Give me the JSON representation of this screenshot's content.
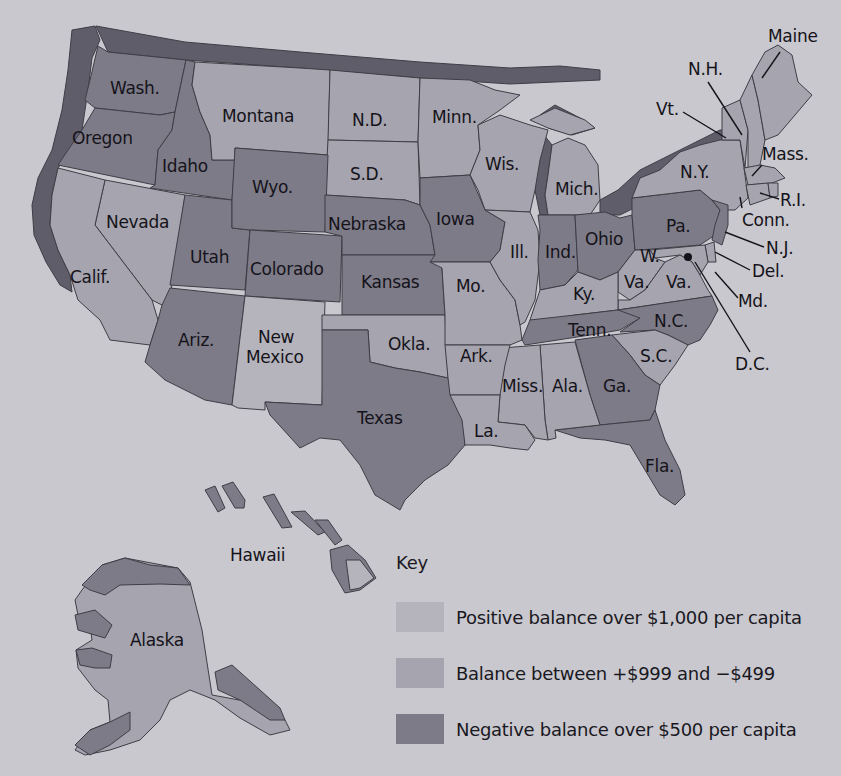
{
  "map": {
    "title": "",
    "legend": {
      "title": "Key",
      "items": [
        {
          "id": "pos",
          "label": "Positive balance over $1,000 per capita",
          "color": "#b5b4bd"
        },
        {
          "id": "bal",
          "label": "Balance between +$999 and −$499",
          "color": "#a6a4ae"
        },
        {
          "id": "neg",
          "label": "Negative balance over $500 per capita",
          "color": "#7e7b88"
        }
      ]
    },
    "states": {
      "wash": {
        "label": "Wash.",
        "category": "neg"
      },
      "oregon": {
        "label": "Oregon",
        "category": "neg"
      },
      "idaho": {
        "label": "Idaho",
        "category": "neg"
      },
      "montana": {
        "label": "Montana",
        "category": "bal"
      },
      "nd": {
        "label": "N.D.",
        "category": "bal"
      },
      "sd": {
        "label": "S.D.",
        "category": "bal"
      },
      "minn": {
        "label": "Minn.",
        "category": "bal"
      },
      "wis": {
        "label": "Wis.",
        "category": "bal"
      },
      "mich": {
        "label": "Mich.",
        "category": "bal"
      },
      "wyo": {
        "label": "Wyo.",
        "category": "neg"
      },
      "nevada": {
        "label": "Nevada",
        "category": "bal"
      },
      "calif": {
        "label": "Calif.",
        "category": "bal"
      },
      "utah": {
        "label": "Utah",
        "category": "neg"
      },
      "colorado": {
        "label": "Colorado",
        "category": "neg"
      },
      "nebraska": {
        "label": "Nebraska",
        "category": "neg"
      },
      "kansas": {
        "label": "Kansas",
        "category": "neg"
      },
      "iowa": {
        "label": "Iowa",
        "category": "neg"
      },
      "ill": {
        "label": "Ill.",
        "category": "bal"
      },
      "ind": {
        "label": "Ind.",
        "category": "neg"
      },
      "ohio": {
        "label": "Ohio",
        "category": "neg"
      },
      "pa": {
        "label": "Pa.",
        "category": "neg"
      },
      "ny": {
        "label": "N.Y.",
        "category": "bal"
      },
      "vt": {
        "label": "Vt.",
        "category": "bal"
      },
      "nh": {
        "label": "N.H.",
        "category": "bal"
      },
      "maine": {
        "label": "Maine",
        "category": "bal"
      },
      "mass": {
        "label": "Mass.",
        "category": "bal"
      },
      "ri": {
        "label": "R.I.",
        "category": "bal"
      },
      "conn": {
        "label": "Conn.",
        "category": "bal"
      },
      "nj": {
        "label": "N.J.",
        "category": "neg"
      },
      "del": {
        "label": "Del.",
        "category": "bal"
      },
      "md": {
        "label": "Md.",
        "category": "bal"
      },
      "dc": {
        "label": "D.C.",
        "category": "bal"
      },
      "wva": {
        "label": "W. Va.",
        "category": "bal"
      },
      "va": {
        "label": "Va.",
        "category": "bal"
      },
      "ky": {
        "label": "Ky.",
        "category": "bal"
      },
      "tenn": {
        "label": "Tenn.",
        "category": "neg"
      },
      "nc": {
        "label": "N.C.",
        "category": "neg"
      },
      "sc": {
        "label": "S.C.",
        "category": "bal"
      },
      "ga": {
        "label": "Ga.",
        "category": "neg"
      },
      "fla": {
        "label": "Fla.",
        "category": "neg"
      },
      "ala": {
        "label": "Ala.",
        "category": "bal"
      },
      "miss": {
        "label": "Miss.",
        "category": "bal"
      },
      "la": {
        "label": "La.",
        "category": "bal"
      },
      "ark": {
        "label": "Ark.",
        "category": "bal"
      },
      "mo": {
        "label": "Mo.",
        "category": "bal"
      },
      "okla": {
        "label": "Okla.",
        "category": "bal"
      },
      "texas": {
        "label": "Texas",
        "category": "neg"
      },
      "nm": {
        "label": "New Mexico",
        "label_line1": "New",
        "label_line2": "Mexico",
        "category": "pos"
      },
      "ariz": {
        "label": "Ariz.",
        "category": "neg"
      },
      "alaska": {
        "label": "Alaska",
        "category": "bal"
      },
      "hawaii": {
        "label": "Hawaii",
        "category": "pos"
      }
    }
  }
}
